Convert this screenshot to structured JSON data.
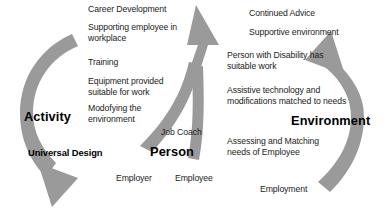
{
  "diagram": {
    "type": "cycle-diagram",
    "colors": {
      "arrow_gray": "#9a9a9a",
      "text_dark": "#1c1c1c",
      "background": "#ffffff"
    },
    "pillars": [
      {
        "id": "activity",
        "label": "Activity"
      },
      {
        "id": "person",
        "label": "Person"
      },
      {
        "id": "environment",
        "label": "Environment"
      }
    ],
    "activity_column": {
      "items": [
        "Career Development",
        "Supporting employee in",
        "workplace",
        "Training",
        "Equipment provided",
        "suitable for work",
        "Modofying the",
        "environment"
      ],
      "line1": "Career Development",
      "line2a": "Supporting employee in",
      "line2b": "workplace",
      "line3": "Training",
      "line4a": "Equipment provided",
      "line4b": "suitable for work",
      "line5a": "Modofying the",
      "line5b": "environment",
      "footer": "Universal Design"
    },
    "environment_column": {
      "items": [
        "Continued Advice",
        "Supportive environment",
        "Person with Disability has",
        "suitable work",
        "Assistive technology and",
        "modifications matched to needs",
        "Assessing and Matching",
        "needs of Employee",
        "Employment"
      ],
      "line1": "Continued Advice",
      "line2": "Supportive environment",
      "line3a": "Person with Disability has",
      "line3b": "suitable work",
      "line4a": "Assistive technology and",
      "line4b": "modifications matched to needs",
      "line5a": "Assessing and Matching",
      "line5b": "needs of Employee",
      "footer": "Employment"
    },
    "person_group": {
      "job_coach": "Job Coach",
      "employer": "Employer",
      "employee": "Employee"
    }
  }
}
